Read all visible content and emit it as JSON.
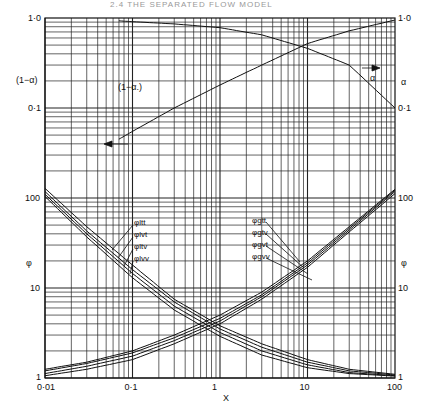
{
  "header": {
    "running_title": "2.4  THE SEPARATED FLOW MODEL"
  },
  "chart_data": {
    "type": "line",
    "xlabel": "X",
    "xscale": "log",
    "xlim": [
      0.01,
      100
    ],
    "x_ticks": [
      "0·01",
      "0·1",
      "1",
      "10",
      "100"
    ],
    "panels": [
      {
        "name": "void-fraction",
        "ylim": [
          0.1,
          1.0
        ],
        "yscale": "log",
        "left_axis_label": "(1−α)",
        "right_axis_label": "α",
        "left_ticks": [
          "1·0",
          "0·1"
        ],
        "right_ticks": [
          "1·0",
          "0·1"
        ],
        "annotations": [
          {
            "text": "(1−α.)",
            "arrow": "left"
          },
          {
            "text": "α",
            "arrow": "right"
          }
        ],
        "series": [
          {
            "name": "alpha",
            "axis": "right",
            "x": [
              0.07,
              0.1,
              0.3,
              1,
              3,
              10,
              30,
              100
            ],
            "y": [
              0.93,
              0.91,
              0.86,
              0.78,
              0.65,
              0.46,
              0.3,
              0.1
            ]
          },
          {
            "name": "(1-alpha)",
            "axis": "left",
            "x": [
              0.07,
              0.1,
              0.3,
              1,
              3,
              10,
              30,
              100
            ],
            "y": [
              0.045,
              0.055,
              0.1,
              0.18,
              0.3,
              0.52,
              0.72,
              0.95
            ]
          }
        ]
      },
      {
        "name": "phi",
        "ylim": [
          1,
          100
        ],
        "yscale": "log",
        "left_axis_label": "φ",
        "right_axis_label": "φ",
        "left_ticks": [
          "100",
          "10",
          "1"
        ],
        "right_ticks": [
          "100",
          "10",
          "1"
        ],
        "legend_liquid": [
          "φltt",
          "φlvt",
          "φltv",
          "φlvv"
        ],
        "legend_gas": [
          "φgtt",
          "φgtv",
          "φgvt",
          "φgvv"
        ],
        "x": [
          0.01,
          0.03,
          0.1,
          0.3,
          1,
          3,
          10,
          30,
          100
        ],
        "series": [
          {
            "name": "φltt",
            "values": [
              128,
              48,
              18,
              7.5,
              3.8,
              2.4,
              1.6,
              1.25,
              1.1
            ]
          },
          {
            "name": "φlvt",
            "values": [
              118,
              43,
              16,
              7,
              3.5,
              2.2,
              1.5,
              1.2,
              1.08
            ]
          },
          {
            "name": "φltv",
            "values": [
              110,
              40,
              14.5,
              6.3,
              3.2,
              2.0,
              1.4,
              1.15,
              1.06
            ]
          },
          {
            "name": "φlvv",
            "values": [
              104,
              37,
              13,
              5.7,
              2.9,
              1.8,
              1.3,
              1.12,
              1.05
            ]
          },
          {
            "name": "φgtt",
            "values": [
              1.25,
              1.5,
              2.0,
              3.0,
              5.0,
              9.0,
              20,
              48,
              125
            ]
          },
          {
            "name": "φgtv",
            "values": [
              1.2,
              1.45,
              1.9,
              2.8,
              4.6,
              8.4,
              19,
              46,
              122
            ]
          },
          {
            "name": "φgvt",
            "values": [
              1.12,
              1.35,
              1.75,
              2.6,
              4.3,
              8.0,
              18,
              44,
              118
            ]
          },
          {
            "name": "φgvv",
            "values": [
              1.06,
              1.25,
              1.6,
              2.4,
              4.0,
              7.5,
              17,
              42,
              112
            ]
          }
        ]
      }
    ],
    "grid": true
  }
}
